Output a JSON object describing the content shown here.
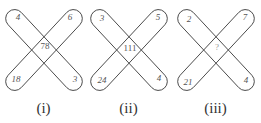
{
  "figures": [
    {
      "caption": "(i)",
      "top_left": "4",
      "top_right": "6",
      "bottom_left": "18",
      "bottom_right": "3",
      "center": "78"
    },
    {
      "caption": "(ii)",
      "top_left": "3",
      "top_right": "5",
      "bottom_left": "24",
      "bottom_right": "4",
      "center": "111"
    },
    {
      "caption": "(iii)",
      "top_left": "2",
      "top_right": "7",
      "bottom_left": "21",
      "bottom_right": "4",
      "center": "?"
    }
  ]
}
